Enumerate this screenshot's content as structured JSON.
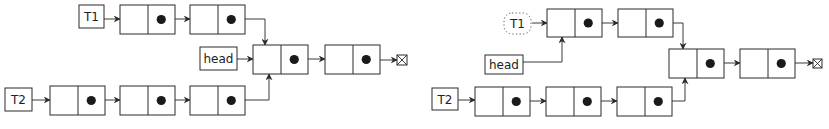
{
  "diagrams": [
    {
      "id": "left",
      "labels": {
        "t1": {
          "text": "T1",
          "x": 79,
          "y": 5,
          "w": 25,
          "h": 23,
          "style": "solid"
        },
        "head": {
          "text": "head",
          "x": 200,
          "y": 47,
          "w": 37,
          "h": 23,
          "style": "solid"
        },
        "t2": {
          "text": "T2",
          "x": 5,
          "y": 88,
          "w": 27,
          "h": 23,
          "style": "solid"
        }
      },
      "nodes": [
        {
          "id": "t1_n1",
          "x": 120,
          "y": 5,
          "w": 55,
          "h": 29
        },
        {
          "id": "t1_n2",
          "x": 190,
          "y": 5,
          "w": 55,
          "h": 29
        },
        {
          "id": "shared_n1",
          "x": 253,
          "y": 45,
          "w": 55,
          "h": 29
        },
        {
          "id": "shared_n2",
          "x": 325,
          "y": 45,
          "w": 55,
          "h": 29
        },
        {
          "id": "t2_n1",
          "x": 50,
          "y": 86,
          "w": 55,
          "h": 29
        },
        {
          "id": "t2_n2",
          "x": 120,
          "y": 86,
          "w": 55,
          "h": 29
        },
        {
          "id": "t2_n3",
          "x": 190,
          "y": 86,
          "w": 55,
          "h": 29
        }
      ],
      "null_terminator": {
        "x": 397,
        "y": 55,
        "size": 10
      },
      "edges": [
        {
          "from": "T1",
          "to": "t1_n1",
          "path": "M104,19 L120,19"
        },
        {
          "from": "t1_n1",
          "to": "t1_n2",
          "path": "M161,19 L190,19"
        },
        {
          "from": "t1_n2",
          "to": "shared_n1",
          "path": "M231,19 L265,19 L265,45"
        },
        {
          "from": "head",
          "to": "shared_n1",
          "path": "M237,59 L253,59"
        },
        {
          "from": "shared_n1",
          "to": "shared_n2",
          "path": "M294,59 L325,59"
        },
        {
          "from": "shared_n2",
          "to": "null",
          "path": "M366,60 L397,60"
        },
        {
          "from": "T2",
          "to": "t2_n1",
          "path": "M32,100 L50,100"
        },
        {
          "from": "t2_n1",
          "to": "t2_n2",
          "path": "M91,100 L120,100"
        },
        {
          "from": "t2_n2",
          "to": "t2_n3",
          "path": "M161,100 L190,100"
        },
        {
          "from": "t2_n3",
          "to": "shared_n1",
          "path": "M231,100 L269,100 L269,74"
        }
      ]
    },
    {
      "id": "right",
      "labels": {
        "t1": {
          "text": "T1",
          "x": 504,
          "y": 13,
          "w": 27,
          "h": 21,
          "style": "dotted"
        },
        "head": {
          "text": "head",
          "x": 485,
          "y": 55,
          "w": 38,
          "h": 19,
          "style": "solid"
        },
        "t2": {
          "text": "T2",
          "x": 432,
          "y": 88,
          "w": 26,
          "h": 22,
          "style": "solid"
        }
      },
      "nodes": [
        {
          "id": "t1_n1",
          "x": 547,
          "y": 9,
          "w": 55,
          "h": 28
        },
        {
          "id": "t1_n2",
          "x": 618,
          "y": 9,
          "w": 55,
          "h": 28
        },
        {
          "id": "shared_n1",
          "x": 669,
          "y": 49,
          "w": 55,
          "h": 29
        },
        {
          "id": "shared_n2",
          "x": 740,
          "y": 49,
          "w": 55,
          "h": 29
        },
        {
          "id": "t2_n1",
          "x": 475,
          "y": 87,
          "w": 55,
          "h": 29
        },
        {
          "id": "t2_n2",
          "x": 546,
          "y": 87,
          "w": 55,
          "h": 29
        },
        {
          "id": "t2_n3",
          "x": 617,
          "y": 87,
          "w": 55,
          "h": 29
        }
      ],
      "null_terminator": {
        "x": 813,
        "y": 59,
        "size": 9
      },
      "edges": [
        {
          "from": "T1",
          "to": "t1_n1",
          "path": "M532,23 L547,23"
        },
        {
          "from": "t1_n1",
          "to": "t1_n2",
          "path": "M588,23 L618,23"
        },
        {
          "from": "t1_n2",
          "to": "shared_n1",
          "path": "M659,23 L683,23 L683,49"
        },
        {
          "from": "head",
          "to": "t1_n1",
          "path": "M523,62 L562,62 L562,37"
        },
        {
          "from": "shared_n1",
          "to": "shared_n2",
          "path": "M710,63 L740,63"
        },
        {
          "from": "shared_n2",
          "to": "null",
          "path": "M781,63 L813,63"
        },
        {
          "from": "T2",
          "to": "t2_n1",
          "path": "M458,100 L475,100"
        },
        {
          "from": "t2_n1",
          "to": "t2_n2",
          "path": "M516,101 L546,101"
        },
        {
          "from": "t2_n2",
          "to": "t2_n3",
          "path": "M587,101 L617,101"
        },
        {
          "from": "t2_n3",
          "to": "shared_n1",
          "path": "M658,101 L685,101 L685,78"
        }
      ]
    }
  ],
  "colors": {
    "stroke": "#2b2b2b",
    "pointer_dot": "#1a1a1a",
    "background": "#ffffff"
  }
}
